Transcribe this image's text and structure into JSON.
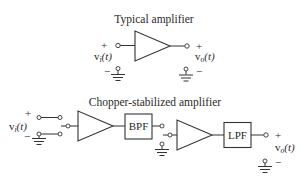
{
  "typical": {
    "title": "Typical amplifier",
    "input": {
      "plus": "+",
      "minus": "−",
      "label_v": "v",
      "label_sub": "i",
      "label_arg": "(t)"
    },
    "output": {
      "plus": "+",
      "minus": "−",
      "label_v": "v",
      "label_sub": "o",
      "label_arg": "(t)"
    }
  },
  "chopper": {
    "title": "Chopper-stabilized amplifier",
    "input": {
      "plus": "+",
      "minus": "−",
      "label_v": "v",
      "label_sub": "i",
      "label_arg": "(t)"
    },
    "blocks": {
      "bpf": "BPF",
      "lpf": "LPF"
    },
    "output": {
      "plus": "+",
      "minus": "−",
      "label_v": "v",
      "label_sub": "o",
      "label_arg": "(t)"
    }
  },
  "colors": {
    "stroke": "#333333",
    "background": "#ffffff"
  }
}
